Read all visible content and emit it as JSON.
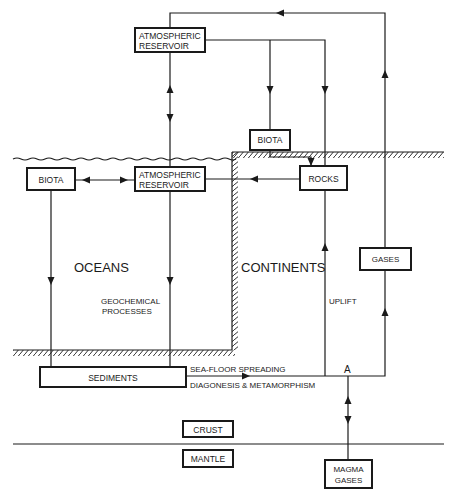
{
  "diagram": {
    "type": "geochemical-cycle-flow-diagram",
    "boxes": {
      "atmos_top": {
        "line1": "ATMOSPHERIC",
        "line2": "RESERVOIR"
      },
      "biota_land": {
        "label": "BIOTA"
      },
      "biota_ocean": {
        "label": "BIOTA"
      },
      "atmos_ocean": {
        "line1": "ATMOSPHERIC",
        "line2": "RESERVOIR"
      },
      "rocks": {
        "label": "ROCKS"
      },
      "gases": {
        "label": "GASES"
      },
      "sediments": {
        "label": "SEDIMENTS"
      },
      "crust": {
        "label": "CRUST"
      },
      "mantle": {
        "label": "MANTLE"
      },
      "magma": {
        "line1": "MAGMA",
        "line2": "GASES"
      }
    },
    "regions": {
      "oceans": "OCEANS",
      "continents": "CONTINENTS"
    },
    "process_labels": {
      "geochem_line1": "GEOCHEMICAL",
      "geochem_line2": "PROCESSES",
      "uplift": "UPLIFT",
      "seafloor": "SEA-FLOOR SPREADING",
      "diagenesis": "DIAGONESIS & METAMORPHISM",
      "point_a": "A"
    },
    "colors": {
      "ink": "#1a1a1a",
      "background": "#ffffff"
    }
  }
}
